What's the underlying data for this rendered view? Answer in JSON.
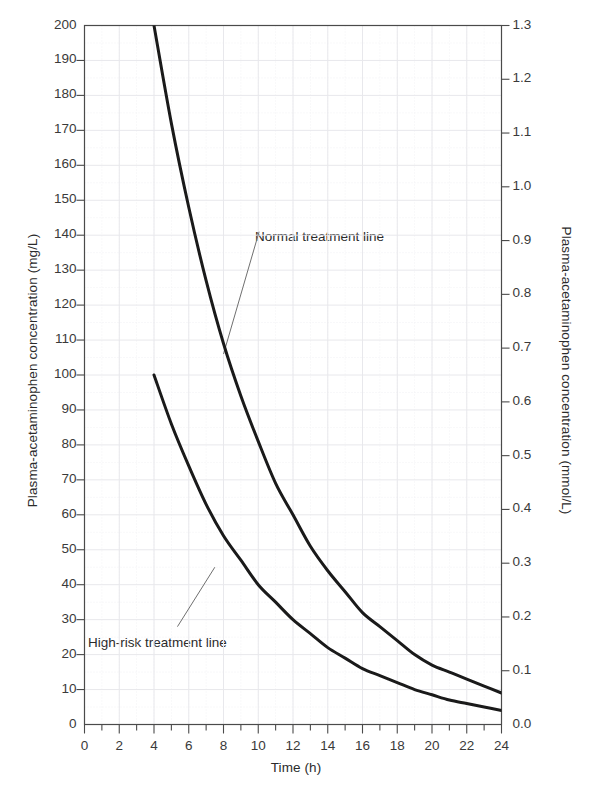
{
  "chart_data": {
    "type": "line",
    "title": "",
    "xlabel": "Time (h)",
    "ylabel": "Plasma-acetaminophen concentration (mg/L)",
    "ylabel_right": "Plasma-acetaminophen concentration (mmol/L)",
    "xlim": [
      0,
      24
    ],
    "ylim": [
      0,
      200
    ],
    "ylim_right": [
      0.0,
      1.3
    ],
    "grid": true,
    "legend": "none",
    "xticks": [
      0,
      2,
      4,
      6,
      8,
      10,
      12,
      14,
      16,
      18,
      20,
      22,
      24
    ],
    "xtick_labels": [
      "0",
      "2",
      "4",
      "6",
      "8",
      "10",
      "12",
      "14",
      "16",
      "18",
      "20",
      "22",
      "24"
    ],
    "xminor_step": 1,
    "yticks": [
      0,
      10,
      20,
      30,
      40,
      50,
      60,
      70,
      80,
      90,
      100,
      110,
      120,
      130,
      140,
      150,
      160,
      170,
      180,
      190,
      200
    ],
    "ytick_labels": [
      "0",
      "10",
      "20",
      "30",
      "40",
      "50",
      "60",
      "70",
      "80",
      "90",
      "100",
      "110",
      "120",
      "130",
      "140",
      "150",
      "160",
      "170",
      "180",
      "190",
      "200"
    ],
    "yticks_right": [
      0.0,
      0.1,
      0.2,
      0.3,
      0.4,
      0.5,
      0.6,
      0.7,
      0.8,
      0.9,
      1.0,
      1.1,
      1.2,
      1.3
    ],
    "ytick_labels_right": [
      "0.0",
      "0.1",
      "0.2",
      "0.3",
      "0.4",
      "0.5",
      "0.6",
      "0.7",
      "0.8",
      "0.9",
      "1.0",
      "1.1",
      "1.2",
      "1.3"
    ],
    "annotations": [
      {
        "text": "Normal treatment line",
        "x": 12.0,
        "y": 142
      },
      {
        "text": "High-risk treatment line",
        "x": 4.3,
        "y": 20
      }
    ],
    "series": [
      {
        "name": "Normal treatment line",
        "x": [
          4,
          5,
          6,
          7,
          8,
          9,
          10,
          11,
          12,
          13,
          14,
          15,
          16,
          17,
          18,
          19,
          20,
          21,
          22,
          23,
          24
        ],
        "y": [
          200,
          172,
          148,
          127,
          109,
          94,
          81,
          69,
          60,
          51,
          44,
          38,
          32,
          28,
          24,
          20,
          17,
          15,
          13,
          11,
          9
        ],
        "y_mmol": [
          1.32,
          1.14,
          0.98,
          0.84,
          0.72,
          0.62,
          0.54,
          0.46,
          0.4,
          0.34,
          0.29,
          0.25,
          0.21,
          0.19,
          0.16,
          0.13,
          0.11,
          0.1,
          0.09,
          0.07,
          0.06
        ],
        "color": "#1a1a1a",
        "linewidth": 3
      },
      {
        "name": "High-risk treatment line",
        "x": [
          4,
          5,
          6,
          7,
          8,
          9,
          10,
          11,
          12,
          13,
          14,
          15,
          16,
          17,
          18,
          19,
          20,
          21,
          22,
          23,
          24
        ],
        "y": [
          100,
          86,
          74,
          63,
          54,
          47,
          40,
          35,
          30,
          26,
          22,
          19,
          16,
          14,
          12,
          10,
          8.5,
          7,
          6,
          5,
          4
        ],
        "y_mmol": [
          0.66,
          0.57,
          0.49,
          0.42,
          0.36,
          0.31,
          0.27,
          0.23,
          0.2,
          0.17,
          0.15,
          0.12,
          0.11,
          0.09,
          0.08,
          0.07,
          0.06,
          0.05,
          0.04,
          0.03,
          0.03
        ],
        "color": "#1a1a1a",
        "linewidth": 3
      }
    ]
  },
  "style": {
    "frame_color": "#4a4a4a",
    "grid_color": "#e8e8ec",
    "minor_grid_color": "#f1f1f4",
    "text_color": "#2b2b2b",
    "leader_color": "#6f6f6f",
    "background": "#ffffff"
  }
}
